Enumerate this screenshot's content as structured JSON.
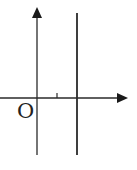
{
  "diagram": {
    "type": "coordinate-axes",
    "origin_label": "O",
    "colors": {
      "stroke": "#2a2a2a",
      "background": "#ffffff"
    },
    "x_axis": {
      "y": 98,
      "x_start": 0,
      "x_end": 128,
      "arrow": "right"
    },
    "y_axis": {
      "x": 37,
      "y_start": 155,
      "y_end": 8,
      "arrow": "up"
    },
    "vertical_line": {
      "x": 77,
      "y_start": 13,
      "y_end": 155
    },
    "tick_mark": {
      "x": 57,
      "y_top": 93,
      "y_bottom": 98
    }
  }
}
